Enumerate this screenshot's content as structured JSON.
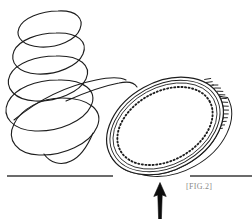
{
  "figure": {
    "caption": "[FIG.2]",
    "background_color": "#ffffff",
    "ink_color": "#1d1d1d",
    "caption_color": "#8a8a8a"
  },
  "elements": {
    "spiral": {
      "name": "spiral-trajectory",
      "description": "Descending helical wobble path of the spinning coin, drawn as overlapping ellipses of increasing size",
      "loop_count": 5,
      "stroke_width": 1.1,
      "color": "#1d1d1d"
    },
    "coin": {
      "name": "coin-disc",
      "description": "Tilted circular coin resting on the ground line, seen in perspective as a rotated ellipse",
      "center_x": 165,
      "center_y": 126,
      "radius_x": 62,
      "radius_y": 44,
      "rotation_deg": -29,
      "edge_thickness": 9,
      "rings": [
        "outer-rim",
        "inner-rim",
        "dotted-ring"
      ],
      "dot_count": 96,
      "reeding_count": 54,
      "color": "#1d1d1d"
    },
    "ground_line_left": {
      "name": "ground-line-left",
      "x1": 7,
      "x2": 113,
      "y": 176,
      "stroke_width": 1.6,
      "color": "#3a3a3a"
    },
    "ground_line_right": {
      "name": "ground-line-right",
      "x1": 190,
      "x2": 252,
      "y": 176,
      "stroke_width": 1.6,
      "color": "#3a3a3a"
    },
    "arrow": {
      "name": "upward-force-arrow",
      "description": "Solid black arrow pointing up at the underside of the coin",
      "tip_x": 160,
      "tip_y": 183,
      "tail_y": 219,
      "head_width": 11,
      "color": "#0d0d0d"
    }
  }
}
